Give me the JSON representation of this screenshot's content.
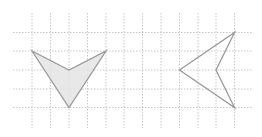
{
  "diagram": {
    "type": "grid-shapes",
    "colors": {
      "background": "#ffffff",
      "grid": "#c8c8c8",
      "outline": "#9a9a9a",
      "fill": "#e4e4e4"
    },
    "grid": {
      "vertical_x": [
        32,
        50.5,
        69,
        87.5,
        106,
        124,
        142.5,
        161,
        179.5,
        198,
        216,
        234.5
      ],
      "vertical_y_range": [
        13,
        128
      ],
      "horizontal_y": [
        32.5,
        51,
        70,
        89,
        107.5
      ],
      "horizontal_x_range": [
        13,
        252
      ]
    },
    "shapes": [
      {
        "name": "shaded-arrowhead",
        "filled": true,
        "points": "32,51 69,70 106,51 69,107.5"
      },
      {
        "name": "outline-arrowhead",
        "filled": false,
        "points": "179.5,70 234.5,32.5 216,70 234.5,107.5"
      }
    ]
  }
}
